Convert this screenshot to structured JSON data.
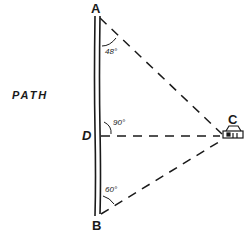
{
  "diagram": {
    "path_label": "PATH",
    "points": {
      "A": "A",
      "B": "B",
      "C": "C",
      "D": "D"
    },
    "angles": {
      "at_A": "48°",
      "at_D": "90°",
      "at_B": "60°"
    },
    "icons": {
      "observer_at_C": "house-icon"
    },
    "colors": {
      "ink": "#1a1a1a",
      "background": "#ffffff"
    }
  }
}
